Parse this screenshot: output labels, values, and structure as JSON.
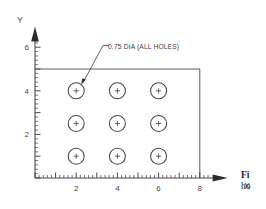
{
  "figure": {
    "background_color": "#ffffff",
    "ink_color": "#4a4a4a",
    "dark_ink_color": "#2b2b2b"
  },
  "axes": {
    "x": {
      "name": "X",
      "arrow_icon": "arrow-right-icon",
      "major_ticks": [
        2,
        4,
        6,
        8
      ],
      "major_tick_labels": [
        "2",
        "4",
        "6",
        "8"
      ],
      "range": [
        0,
        9.4
      ],
      "minor_tick_step": 0.2
    },
    "y": {
      "name": "Y",
      "arrow_icon": "arrow-up-icon",
      "major_ticks": [
        2,
        4,
        6
      ],
      "major_tick_labels": [
        "2",
        "4",
        "6"
      ],
      "range": [
        0,
        6.9
      ],
      "minor_tick_step": 0.2
    }
  },
  "plate": {
    "origin": [
      0,
      0
    ],
    "width": 8,
    "height": 5
  },
  "annotation": {
    "note": "0.75 DIA (ALL HOLES)",
    "leader_target_hole": [
      2,
      4
    ]
  },
  "chart_data": {
    "type": "scatter",
    "title": "",
    "xlabel": "X",
    "ylabel": "Y",
    "xlim": [
      0,
      9.4
    ],
    "ylim": [
      0,
      6.9
    ],
    "grid": false,
    "legend": "none",
    "hole_diameter": 0.75,
    "marker": "circle-with-center-cross",
    "series": [
      {
        "name": "holes",
        "points": [
          {
            "x": 2,
            "y": 4
          },
          {
            "x": 4,
            "y": 4
          },
          {
            "x": 6,
            "y": 4
          },
          {
            "x": 2,
            "y": 2.5
          },
          {
            "x": 4,
            "y": 2.5
          },
          {
            "x": 6,
            "y": 2.5
          },
          {
            "x": 2,
            "y": 1
          },
          {
            "x": 4,
            "y": 1
          },
          {
            "x": 6,
            "y": 1
          }
        ]
      }
    ],
    "annotations": [
      {
        "text": "0.75 DIA (ALL HOLES)",
        "points_to": [
          2,
          4
        ]
      }
    ]
  },
  "caption": {
    "line_1": "Fi",
    "line_2": "ho"
  }
}
